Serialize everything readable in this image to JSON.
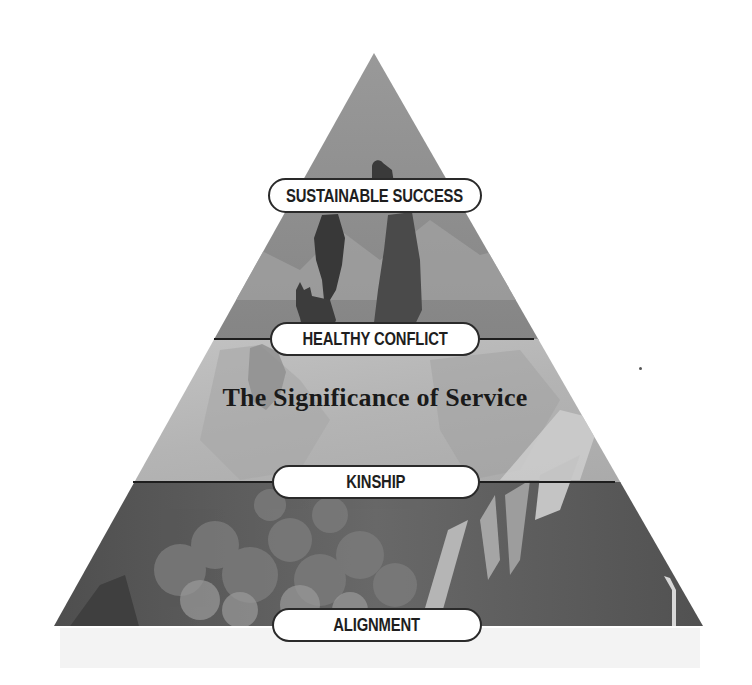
{
  "diagram": {
    "type": "pyramid",
    "title": "The Significance of Service",
    "levels": [
      {
        "label": "Sustainable Success",
        "position": "top"
      },
      {
        "label": "Healthy Conflict",
        "position": "upper-middle"
      },
      {
        "label": "Kinship",
        "position": "lower-middle"
      },
      {
        "label": "Alignment",
        "position": "base"
      }
    ],
    "colors": {
      "top_band": "#8c8c8c",
      "middle_band": "#b9b9b9",
      "bottom_band": "#555555",
      "silhouette": "#3c3c3c",
      "pill_border": "#2a2a2a",
      "pill_fill": "#ffffff",
      "text": "#1a1a1a"
    }
  }
}
